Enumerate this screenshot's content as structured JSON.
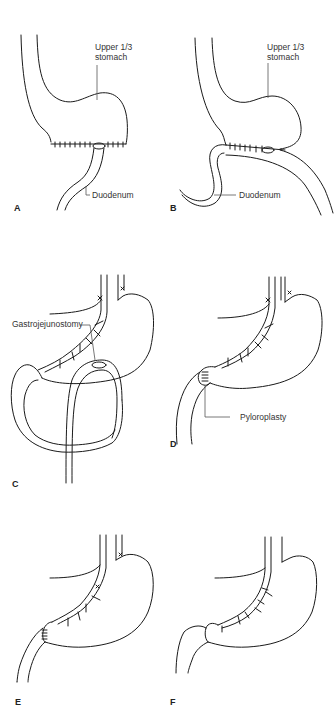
{
  "figure": {
    "panels": [
      {
        "id": "A",
        "label": "A",
        "annotations": [
          "Upper 1/3",
          "stomach",
          "Duodenum"
        ]
      },
      {
        "id": "B",
        "label": "B",
        "annotations": [
          "Upper 1/3",
          "stomach",
          "Duodenum"
        ]
      },
      {
        "id": "C",
        "label": "C",
        "annotations": [
          "Gastrojejunostomy"
        ]
      },
      {
        "id": "D",
        "label": "D",
        "annotations": [
          "Pyloroplasty"
        ]
      },
      {
        "id": "E",
        "label": "E",
        "annotations": []
      },
      {
        "id": "F",
        "label": "F",
        "annotations": []
      }
    ]
  },
  "labels": {
    "a_upper_line1": "Upper 1/3",
    "a_upper_line2": "stomach",
    "a_duodenum": "Duodenum",
    "b_upper_line1": "Upper 1/3",
    "b_upper_line2": "stomach",
    "b_duodenum": "Duodenum",
    "c_gastrojejunostomy": "Gastrojejunostomy",
    "d_pyloroplasty": "Pyloroplasty",
    "panel_a": "A",
    "panel_b": "B",
    "panel_c": "C",
    "panel_d": "D",
    "panel_e": "E",
    "panel_f": "F"
  }
}
